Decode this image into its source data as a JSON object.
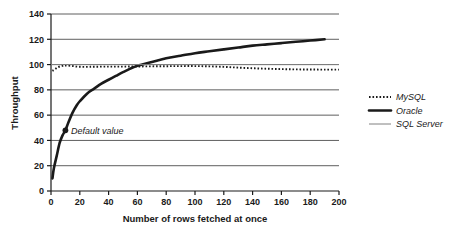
{
  "chart_data": {
    "type": "line",
    "title": "",
    "xlabel": "Number of rows fetched at once",
    "ylabel": "Throughput",
    "xlim": [
      0,
      200
    ],
    "ylim": [
      0,
      140
    ],
    "xticks": [
      "0",
      "20",
      "40",
      "60",
      "80",
      "100",
      "120",
      "140",
      "160",
      "180",
      "200"
    ],
    "yticks": [
      "0",
      "20",
      "40",
      "60",
      "80",
      "100",
      "120",
      "140"
    ],
    "grid": "horizontal",
    "legend_position": "right",
    "series": [
      {
        "name": "MySQL",
        "style": "dotted",
        "color": "#1a1a1a",
        "x": [
          1,
          3,
          5,
          8,
          10,
          14,
          18,
          22,
          26,
          30,
          40,
          50,
          60,
          70,
          80,
          90,
          100,
          110,
          120,
          130,
          140,
          150,
          160,
          170,
          180,
          190,
          200
        ],
        "y": [
          95,
          96.5,
          98,
          99,
          99.2,
          99,
          98.4,
          98.2,
          98.2,
          98.3,
          98.4,
          98.4,
          98.5,
          98.6,
          98.7,
          98.8,
          98.8,
          98.6,
          98.2,
          97.6,
          97.1,
          96.7,
          96.4,
          96.2,
          96.1,
          96.0,
          96.0
        ]
      },
      {
        "name": "Oracle",
        "style": "solid-thick",
        "color": "#1a1a1a",
        "x": [
          1,
          2,
          4,
          6,
          8,
          10,
          12,
          15,
          18,
          20,
          25,
          30,
          35,
          40,
          45,
          50,
          60,
          70,
          80,
          90,
          100,
          110,
          120,
          130,
          140,
          150,
          160,
          170,
          180,
          190
        ],
        "y": [
          10,
          18,
          28,
          38,
          44,
          48,
          54,
          62,
          68,
          71,
          77,
          81,
          85,
          88,
          91,
          94,
          99,
          102,
          105,
          107,
          109,
          110.5,
          112,
          113.5,
          115,
          116,
          117,
          118,
          119,
          120
        ]
      },
      {
        "name": "SQL Server",
        "style": "solid-thin",
        "color": "#808080",
        "x": [
          0,
          200
        ],
        "y": [
          100,
          100
        ]
      }
    ],
    "annotations": [
      {
        "label": "Default value",
        "x": 10,
        "y": 48,
        "marker": "filled-circle"
      }
    ]
  },
  "legend": {
    "items": [
      {
        "label": "MySQL",
        "style": "dotted"
      },
      {
        "label": "Oracle",
        "style": "solid-thick"
      },
      {
        "label": "SQL Server",
        "style": "solid-thin"
      }
    ]
  }
}
